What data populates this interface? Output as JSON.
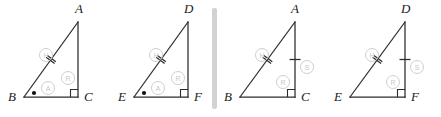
{
  "figure": {
    "title": "",
    "background_color": "#ffffff",
    "stroke_color": "#2b2b2b",
    "marking_color": "#cfcfcf",
    "divider_color": "#d2d2d2"
  },
  "divider": {
    "name": "vertical-divider",
    "x": 212,
    "y": 8,
    "width": 5,
    "height": 101
  },
  "triangles": [
    {
      "id": "triangle-1",
      "vertices": {
        "apex": {
          "label": "A",
          "x": 78,
          "y": 97,
          "label_x": 75,
          "label_y": 13
        },
        "left": {
          "label": "B",
          "x": 24,
          "y": 97,
          "label_x": 8,
          "label_y": 101
        },
        "right": {
          "label": "C",
          "x": 78,
          "y": 97,
          "label_x": 84,
          "label_y": 101
        }
      },
      "geometry": {
        "ax": 78,
        "ay": 22,
        "bx": 24,
        "by": 97,
        "cx": 78,
        "cy": 97
      },
      "right_angle_at": "C",
      "markings": [
        {
          "letter": "H",
          "cx": 46,
          "cy": 55,
          "r": 6.5,
          "name": "circled-letter-h"
        },
        {
          "letter": "A",
          "cx": 48,
          "cy": 88,
          "r": 6.5,
          "name": "circled-letter-a"
        },
        {
          "letter": "R",
          "cx": 68,
          "cy": 78,
          "r": 6.5,
          "name": "circled-letter-r"
        }
      ],
      "hypotenuse_ticks": 2,
      "leg_ticks": 0,
      "angle_dot": true,
      "angle_dot_pos": {
        "x": 34,
        "y": 93
      }
    },
    {
      "id": "triangle-2",
      "vertices": {
        "apex": {
          "label": "D",
          "x": 188,
          "y": 97,
          "label_x": 184,
          "label_y": 13
        },
        "left": {
          "label": "E",
          "x": 134,
          "y": 97,
          "label_x": 118,
          "label_y": 101
        },
        "right": {
          "label": "F",
          "x": 188,
          "y": 97,
          "label_x": 194,
          "label_y": 101
        }
      },
      "geometry": {
        "ax": 188,
        "ay": 22,
        "bx": 134,
        "by": 97,
        "cx": 188,
        "cy": 97
      },
      "right_angle_at": "F",
      "markings": [
        {
          "letter": "H",
          "cx": 156,
          "cy": 55,
          "r": 6.5,
          "name": "circled-letter-h"
        },
        {
          "letter": "A",
          "cx": 158,
          "cy": 88,
          "r": 6.5,
          "name": "circled-letter-a"
        },
        {
          "letter": "R",
          "cx": 178,
          "cy": 78,
          "r": 6.5,
          "name": "circled-letter-r"
        }
      ],
      "hypotenuse_ticks": 2,
      "leg_ticks": 0,
      "angle_dot": true,
      "angle_dot_pos": {
        "x": 144,
        "y": 93
      }
    },
    {
      "id": "triangle-3",
      "vertices": {
        "apex": {
          "label": "A",
          "x": 295,
          "y": 97,
          "label_x": 291,
          "label_y": 13
        },
        "left": {
          "label": "B",
          "x": 240,
          "y": 97,
          "label_x": 224,
          "label_y": 101
        },
        "right": {
          "label": "C",
          "x": 295,
          "y": 97,
          "label_x": 301,
          "label_y": 101
        }
      },
      "geometry": {
        "ax": 295,
        "ay": 22,
        "bx": 240,
        "by": 97,
        "cx": 295,
        "cy": 97
      },
      "right_angle_at": "C",
      "markings": [
        {
          "letter": "H",
          "cx": 262,
          "cy": 55,
          "r": 6.5,
          "name": "circled-letter-h"
        },
        {
          "letter": "S",
          "cx": 307,
          "cy": 67,
          "r": 6.5,
          "name": "circled-letter-s"
        },
        {
          "letter": "R",
          "cx": 283,
          "cy": 82,
          "r": 6.5,
          "name": "circled-letter-r"
        }
      ],
      "hypotenuse_ticks": 2,
      "leg_ticks": 1,
      "angle_dot": false,
      "angle_dot_pos": null
    },
    {
      "id": "triangle-4",
      "vertices": {
        "apex": {
          "label": "D",
          "x": 405,
          "y": 97,
          "label_x": 401,
          "label_y": 13
        },
        "left": {
          "label": "E",
          "x": 350,
          "y": 97,
          "label_x": 334,
          "label_y": 101
        },
        "right": {
          "label": "F",
          "x": 405,
          "y": 97,
          "label_x": 411,
          "label_y": 101
        }
      },
      "geometry": {
        "ax": 405,
        "ay": 22,
        "bx": 350,
        "by": 97,
        "cx": 405,
        "cy": 97
      },
      "right_angle_at": "F",
      "markings": [
        {
          "letter": "H",
          "cx": 372,
          "cy": 55,
          "r": 6.5,
          "name": "circled-letter-h"
        },
        {
          "letter": "S",
          "cx": 417,
          "cy": 67,
          "r": 6.5,
          "name": "circled-letter-s"
        },
        {
          "letter": "R",
          "cx": 393,
          "cy": 82,
          "r": 6.5,
          "name": "circled-letter-r"
        }
      ],
      "hypotenuse_ticks": 2,
      "leg_ticks": 1,
      "angle_dot": false,
      "angle_dot_pos": null
    }
  ]
}
